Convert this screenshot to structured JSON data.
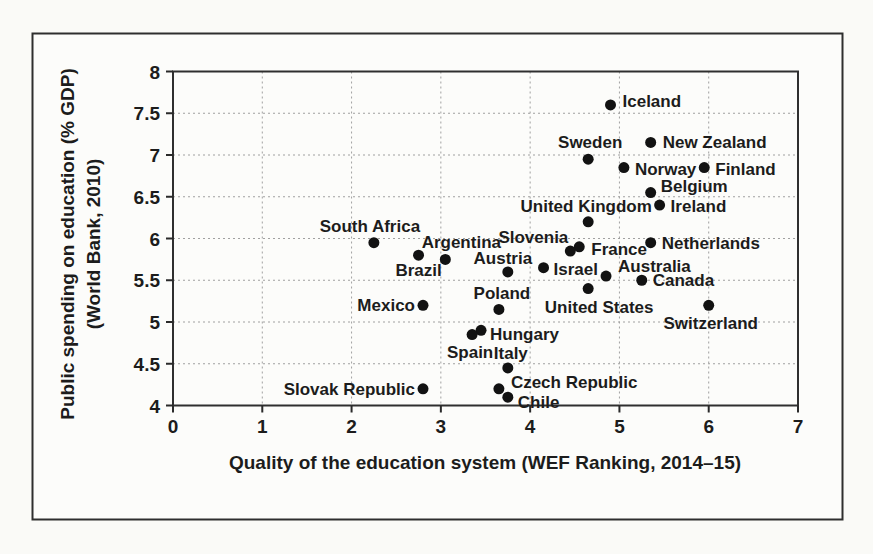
{
  "chart_data": {
    "type": "scatter",
    "title": "",
    "xlabel": "Quality of the education system (WEF Ranking, 2014–15)",
    "ylabel_line1": "Public spending on education (% GDP)",
    "ylabel_line2": "(World Bank, 2010)",
    "xlim": [
      0,
      7
    ],
    "ylim": [
      4,
      8
    ],
    "xticks": [
      0,
      1,
      2,
      3,
      4,
      5,
      6,
      7
    ],
    "yticks": [
      4,
      4.5,
      5,
      5.5,
      6,
      6.5,
      7,
      7.5,
      8
    ],
    "grid": true,
    "legend": "none",
    "marker_color": "#121212",
    "points": [
      {
        "name": "Iceland",
        "x": 4.9,
        "y": 7.6,
        "anchor": "start",
        "dx": 12,
        "dy": -4
      },
      {
        "name": "New Zealand",
        "x": 5.35,
        "y": 7.15,
        "anchor": "start",
        "dx": 12,
        "dy": 0
      },
      {
        "name": "Sweden",
        "x": 4.65,
        "y": 6.95,
        "anchor": "middle",
        "dx": 2,
        "dy": -17
      },
      {
        "name": "Norway",
        "x": 5.05,
        "y": 6.85,
        "anchor": "start",
        "dx": 11,
        "dy": 1
      },
      {
        "name": "Finland",
        "x": 5.95,
        "y": 6.85,
        "anchor": "start",
        "dx": 11,
        "dy": 1
      },
      {
        "name": "Belgium",
        "x": 5.35,
        "y": 6.55,
        "anchor": "start",
        "dx": 10,
        "dy": -7
      },
      {
        "name": "Ireland",
        "x": 5.45,
        "y": 6.4,
        "anchor": "start",
        "dx": 11,
        "dy": 1
      },
      {
        "name": "United Kingdom",
        "x": 4.65,
        "y": 6.2,
        "anchor": "middle",
        "dx": -2,
        "dy": -16
      },
      {
        "name": "Netherlands",
        "x": 5.35,
        "y": 5.95,
        "anchor": "start",
        "dx": 11,
        "dy": 0
      },
      {
        "name": "South Africa",
        "x": 2.25,
        "y": 5.95,
        "anchor": "middle",
        "dx": -4,
        "dy": -17
      },
      {
        "name": "France",
        "x": 4.55,
        "y": 5.9,
        "anchor": "start",
        "dx": 12,
        "dy": 2
      },
      {
        "name": "Slovenia",
        "x": 4.45,
        "y": 5.85,
        "anchor": "end",
        "dx": -2,
        "dy": -14
      },
      {
        "name": "Brazil",
        "x": 2.75,
        "y": 5.8,
        "anchor": "middle",
        "dx": 0,
        "dy": 15
      },
      {
        "name": "Argentina",
        "x": 3.05,
        "y": 5.75,
        "anchor": "middle",
        "dx": 16,
        "dy": -17
      },
      {
        "name": "Israel",
        "x": 4.15,
        "y": 5.65,
        "anchor": "start",
        "dx": 10,
        "dy": 1
      },
      {
        "name": "Austria",
        "x": 3.75,
        "y": 5.6,
        "anchor": "middle",
        "dx": -5,
        "dy": -14
      },
      {
        "name": "Australia",
        "x": 4.85,
        "y": 5.55,
        "anchor": "start",
        "dx": 12,
        "dy": -10
      },
      {
        "name": "Canada",
        "x": 5.25,
        "y": 5.5,
        "anchor": "start",
        "dx": 11,
        "dy": 0
      },
      {
        "name": "United States",
        "x": 4.65,
        "y": 5.4,
        "anchor": "middle",
        "dx": 11,
        "dy": 18
      },
      {
        "name": "Switzerland",
        "x": 6.0,
        "y": 5.2,
        "anchor": "middle",
        "dx": 2,
        "dy": 18
      },
      {
        "name": "Mexico",
        "x": 2.8,
        "y": 5.2,
        "anchor": "end",
        "dx": -8,
        "dy": 0
      },
      {
        "name": "Poland",
        "x": 3.65,
        "y": 5.15,
        "anchor": "middle",
        "dx": 3,
        "dy": -16
      },
      {
        "name": "Hungary",
        "x": 3.45,
        "y": 4.9,
        "anchor": "start",
        "dx": 9,
        "dy": 4
      },
      {
        "name": "Spain",
        "x": 3.35,
        "y": 4.85,
        "anchor": "middle",
        "dx": -2,
        "dy": 17
      },
      {
        "name": "Italy",
        "x": 3.75,
        "y": 4.45,
        "anchor": "middle",
        "dx": 3,
        "dy": -15
      },
      {
        "name": "Slovak Republic",
        "x": 2.8,
        "y": 4.2,
        "anchor": "end",
        "dx": -8,
        "dy": 0
      },
      {
        "name": "Czech Republic",
        "x": 3.65,
        "y": 4.2,
        "anchor": "start",
        "dx": 12,
        "dy": -7
      },
      {
        "name": "Chile",
        "x": 3.75,
        "y": 4.1,
        "anchor": "start",
        "dx": 10,
        "dy": 5
      }
    ]
  }
}
